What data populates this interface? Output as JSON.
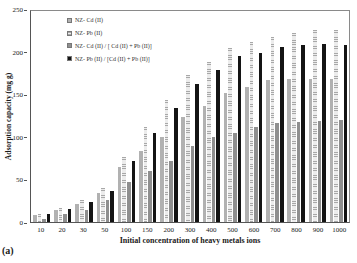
{
  "figure_label": "(a)",
  "chart_data": {
    "type": "bar",
    "title": "",
    "xlabel": "Initial concentration of heavy metals ions",
    "ylabel": "Adsorption capacity (mg g)",
    "ylim": [
      0,
      250
    ],
    "yticks": [
      0,
      50,
      100,
      150,
      200,
      250
    ],
    "grid": false,
    "legend_position": "top-left-inside",
    "categories": [
      "10",
      "20",
      "30",
      "50",
      "100",
      "150",
      "200",
      "300",
      "400",
      "500",
      "600",
      "700",
      "800",
      "900",
      "1000"
    ],
    "series": [
      {
        "name": "NZ- Cd (II)",
        "pattern": "dots",
        "color": "#cdcdcd",
        "values": [
          8,
          14,
          21,
          34,
          65,
          84,
          101,
          125,
          137,
          153,
          160,
          168,
          169,
          170,
          170
        ]
      },
      {
        "name": "NZ- Pb (II)",
        "pattern": "hlines",
        "color": "#ececec",
        "values": [
          10,
          17,
          26,
          40,
          77,
          113,
          144,
          174,
          190,
          206,
          213,
          219,
          224,
          227,
          228
        ]
      },
      {
        "name": "NZ- Cd (II) / [ Cd (II) + Pb (II)]",
        "pattern": "gray",
        "color": "#8f8f8f",
        "values": [
          4,
          9,
          14,
          26,
          47,
          61,
          72,
          90,
          101,
          106,
          113,
          117,
          119,
          120,
          121
        ]
      },
      {
        "name": "NZ- Pb (II) / [Cd (II) + Pb (II)]",
        "pattern": "black",
        "color": "#141414",
        "values": [
          10,
          16,
          24,
          37,
          72,
          105,
          135,
          164,
          180,
          197,
          200,
          207,
          210,
          211,
          210
        ]
      }
    ]
  }
}
